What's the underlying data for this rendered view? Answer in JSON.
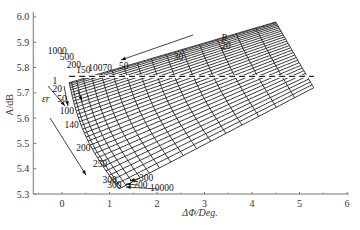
{
  "chart_data": {
    "type": "line",
    "title": "",
    "xlabel": "ΔΦ/Deg.",
    "ylabel": "A/dB",
    "xlim": [
      -0.5,
      6
    ],
    "ylim": [
      5.3,
      6.02
    ],
    "x_ticks": [
      "0",
      "1",
      "2",
      "3",
      "4",
      "5",
      "6"
    ],
    "y_ticks": [
      "5.3",
      "5.4",
      "5.5",
      "5.6",
      "5.7",
      "5.8",
      "5.9",
      "6.0"
    ],
    "grid": false,
    "legend": "none",
    "families": {
      "R": {
        "label": "R",
        "visible_values": [
          "20",
          "30",
          "50",
          "70",
          "100",
          "150",
          "200",
          "500",
          "1000"
        ],
        "arrow_direction": "R decreases toward upper-right"
      },
      "er": {
        "label": "εr",
        "visible_values": [
          "1",
          "20",
          "50",
          "100",
          "140",
          "200",
          "250",
          "300",
          "300",
          "700",
          "10000"
        ],
        "arrow_direction": "εr increases downward"
      }
    },
    "grid_corners": {
      "top_left": [
        0.15,
        5.74
      ],
      "top_right": [
        4.5,
        5.98
      ],
      "bottom_left": [
        1.2,
        5.32
      ],
      "bottom_right": [
        5.3,
        5.72
      ]
    },
    "reference_line": {
      "style": "dashed",
      "y": 5.765,
      "x_range": [
        0.15,
        5.3
      ]
    },
    "annotations": [
      {
        "text": "R",
        "x": 3.35,
        "y": 5.905
      },
      {
        "text": "20",
        "x": 3.35,
        "y": 5.875
      },
      {
        "text": "30",
        "x": 2.35,
        "y": 5.83
      },
      {
        "text": "50",
        "x": 1.2,
        "y": 5.795
      },
      {
        "text": "70",
        "x": 0.85,
        "y": 5.785
      },
      {
        "text": "100",
        "x": 0.55,
        "y": 5.785
      },
      {
        "text": "150",
        "x": 0.3,
        "y": 5.78
      },
      {
        "text": "200",
        "x": 0.1,
        "y": 5.8
      },
      {
        "text": "500",
        "x": -0.05,
        "y": 5.83
      },
      {
        "text": "1000",
        "x": -0.3,
        "y": 5.855
      },
      {
        "text": "1",
        "x": -0.2,
        "y": 5.735
      },
      {
        "text": "20",
        "x": -0.2,
        "y": 5.705
      },
      {
        "text": "εr",
        "x": -0.42,
        "y": 5.665
      },
      {
        "text": "50",
        "x": -0.1,
        "y": 5.665
      },
      {
        "text": "100",
        "x": -0.05,
        "y": 5.615
      },
      {
        "text": "140",
        "x": 0.05,
        "y": 5.56
      },
      {
        "text": "200",
        "x": 0.3,
        "y": 5.47
      },
      {
        "text": "250",
        "x": 0.65,
        "y": 5.405
      },
      {
        "text": "300",
        "x": 0.85,
        "y": 5.345
      },
      {
        "text": "300",
        "x": 0.95,
        "y": 5.325
      },
      {
        "text": "700",
        "x": 1.5,
        "y": 5.325
      },
      {
        "text": "10000",
        "x": 1.85,
        "y": 5.31
      },
      {
        "text": "300",
        "x": 1.62,
        "y": 5.35
      }
    ]
  }
}
